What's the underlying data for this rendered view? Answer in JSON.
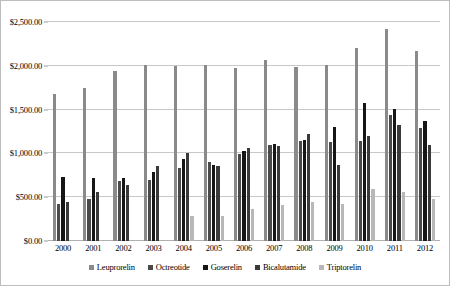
{
  "chart_data": {
    "type": "bar",
    "title": "",
    "subtitle": "",
    "xlabel": "",
    "ylabel": "",
    "ylim": [
      0,
      2500
    ],
    "ytick_step": 500,
    "ytick_labels": [
      "$0.00",
      "$500.00",
      "$1,000.00",
      "$1,500.00",
      "$2,000.00",
      "$2,500.00"
    ],
    "ytick_values": [
      0,
      500,
      1000,
      1500,
      2000,
      2500
    ],
    "grid": true,
    "legend_position": "bottom",
    "categories": [
      "2000",
      "2001",
      "2002",
      "2003",
      "2004",
      "2005",
      "2006",
      "2007",
      "2008",
      "2009",
      "2010",
      "2011",
      "2012"
    ],
    "series": [
      {
        "name": "Leuprorelin",
        "color": "#8a8a8a",
        "values": [
          1680,
          1750,
          1940,
          2010,
          2000,
          2010,
          1980,
          2070,
          1990,
          2010,
          2200,
          2420,
          2170
        ]
      },
      {
        "name": "Octreotide",
        "color": "#4a4a4a",
        "values": [
          420,
          480,
          680,
          700,
          830,
          900,
          990,
          1100,
          1140,
          1130,
          1140,
          1440,
          1290
        ]
      },
      {
        "name": "Goserelin",
        "color": "#161616",
        "values": [
          730,
          720,
          720,
          790,
          940,
          870,
          1030,
          1110,
          1150,
          1300,
          1580,
          1510,
          1370
        ]
      },
      {
        "name": "Bicalutamide",
        "color": "#3a3a3a",
        "values": [
          440,
          560,
          640,
          860,
          1010,
          860,
          1060,
          1090,
          1220,
          870,
          1200,
          1330,
          1100
        ]
      },
      {
        "name": "Triptorelin",
        "color": "#b8b8b8",
        "values": [
          0,
          0,
          0,
          0,
          280,
          290,
          370,
          410,
          440,
          420,
          590,
          560,
          480
        ]
      }
    ]
  }
}
